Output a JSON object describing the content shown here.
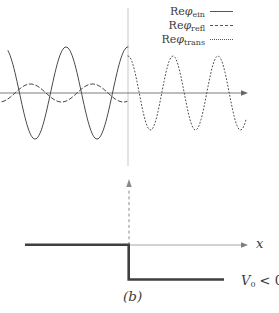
{
  "figure": {
    "legend": {
      "items": [
        {
          "prefix": "Re",
          "symbol": "φ",
          "subscript": "ein",
          "line_style": "solid"
        },
        {
          "prefix": "Re",
          "symbol": "φ",
          "subscript": "refl",
          "line_style": "dashed"
        },
        {
          "prefix": "Re",
          "symbol": "φ",
          "subscript": "trans",
          "line_style": "dotted"
        }
      ]
    },
    "bottom": {
      "x_axis_label": "x",
      "v0_label": {
        "base": "V",
        "sub": "0",
        "rest": " < 0"
      },
      "caption": "(b)"
    },
    "colors": {
      "curve": "#4a4a4a",
      "axis": "#7d7d7d",
      "axis_light": "#a6a6a6",
      "boundary_line": "#d9d9d9",
      "step": "#3f3f3f",
      "dashed_marker": "#8a8a8a",
      "text": "#3c3c3c",
      "background": "#ffffff"
    }
  },
  "chart_data": [
    {
      "type": "line",
      "panel": "wavefunction-plot",
      "title": "",
      "x_axis": {
        "label": "",
        "arrow": true,
        "start_px": 0,
        "end_px": 248,
        "y_px": 93
      },
      "boundary": {
        "x_px": 128,
        "y_top_px": 8,
        "y_bottom_px": 166
      },
      "legend_entries": [
        "Re φ_ein",
        "Re φ_refl",
        "Re φ_trans"
      ],
      "series": [
        {
          "name": "Re φ_ein",
          "region": "x < 0 (incident)",
          "line_style": "solid",
          "amplitude_rel": 1.0,
          "amplitude_px": 46,
          "wavelength_px": 62,
          "phase_max_x_px": 128,
          "x_px_range": [
            8,
            128
          ]
        },
        {
          "name": "Re φ_refl",
          "region": "x < 0 (reflected)",
          "line_style": "dashed",
          "amplitude_rel": 0.2,
          "amplitude_px": 9,
          "wavelength_px": 62,
          "phase_max_x_px": 92.5,
          "x_px_range": [
            2,
            127
          ]
        },
        {
          "name": "Re φ_trans",
          "region": "x > 0 (transmitted)",
          "line_style": "dotted",
          "amplitude_rel": 0.8,
          "amplitude_px": 37,
          "wavelength_px": 45,
          "phase_max_x_px": 128,
          "x_px_range": [
            128,
            246
          ]
        }
      ]
    },
    {
      "type": "line",
      "panel": "potential-step",
      "x_axis": {
        "label": "x",
        "arrow": true,
        "start_px": 25,
        "end_px": 248,
        "y_px": 245
      },
      "step": {
        "zero_level_y_px": 245,
        "v0_level_y_px": 280,
        "step_x_px": 129,
        "left_end_x_px": 25,
        "right_end_x_px": 224,
        "v0_sign": "V₀ < 0"
      },
      "marker_arrow": {
        "x_px": 129,
        "tip_y_px": 179,
        "base_y_px": 245,
        "style": "dashed",
        "direction": "up"
      },
      "caption": "(b)"
    }
  ]
}
